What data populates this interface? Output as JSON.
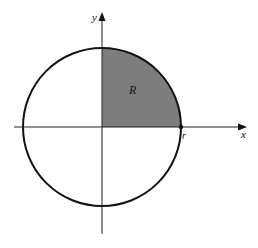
{
  "diagram": {
    "type": "quarter-disk region in circle",
    "labels": {
      "y_axis": "y",
      "x_axis": "x",
      "region": "R",
      "radius_point": "r"
    },
    "geometry": {
      "center": [
        102,
        127
      ],
      "radius": 79,
      "shaded_quadrant": "first (upper-right)"
    },
    "colors": {
      "background": "#ffffff",
      "stroke": "#111111",
      "shading": "#7d7d7d"
    }
  }
}
